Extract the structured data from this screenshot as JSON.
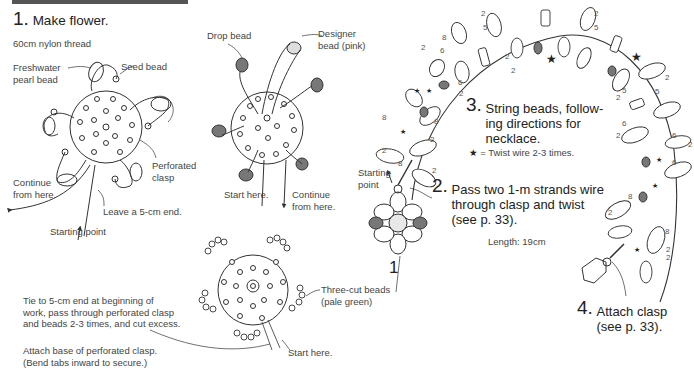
{
  "header": {
    "bar_color": "#555555"
  },
  "step1": {
    "number": "1.",
    "title": "Make flower.",
    "subtitle": "60cm nylon thread",
    "labels": {
      "freshwater_pearl": "Freshwater\npearl bead",
      "seed_bead": "Seed bead",
      "perforated_clasp": "Perforated\nclasp",
      "continue": "Continue\nfrom here.",
      "leave_end": "Leave a 5-cm end.",
      "starting_point": "Starting point"
    }
  },
  "step1b": {
    "labels": {
      "drop_bead": "Drop bead",
      "designer_bead": "Designer\nbead (pink)",
      "start_here": "Start here.",
      "continue": "Continue\nfrom here."
    }
  },
  "step1c": {
    "labels": {
      "three_cut": "Three-cut beads\n(pale green)",
      "start_here": "Start here.",
      "tie_note": "Tie to 5-cm end at beginning of\nwork, pass through perforated clasp\nand beads 2-3 times, and cut excess.",
      "attach_note": "Attach base of perforated clasp.\n(Bend tabs inward to secure.)"
    }
  },
  "step2": {
    "number": "2.",
    "text": "Pass two 1-m strands wire\nthrough clasp and twist\n(see p. 33).",
    "starting_point": "Starting\npoint",
    "flower_label": "1"
  },
  "step3": {
    "number": "3.",
    "text": "String beads, follow-\ning directions for\nnecklace.",
    "legend_symbol": "★",
    "legend_text": "= Twist wire 2-3 times.",
    "length": "Length: 19cm"
  },
  "step4": {
    "number": "4.",
    "text": "Attach clasp\n(see p. 33)."
  },
  "bead_counts": [
    "2",
    "8",
    "2",
    "6",
    "2",
    "5",
    "2",
    "5",
    "2",
    "6",
    "2",
    "5",
    "2",
    "6",
    "2",
    "6",
    "8",
    "2",
    "8",
    "2",
    "8",
    "2"
  ],
  "colors": {
    "line": "#333333",
    "drop_bead": "#777777",
    "designer_bead": "#cccccc",
    "text": "#333333"
  }
}
